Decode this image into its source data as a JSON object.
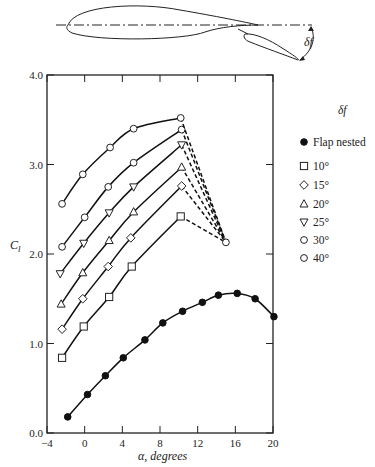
{
  "figure": {
    "diagram": {
      "description": "Airfoil with slotted trailing-edge flap deflected by angle delta_f",
      "flap_angle_label": "δf"
    }
  },
  "chart_data": {
    "type": "line",
    "title": "",
    "xlabel": "α, degrees",
    "ylabel": "Cl",
    "xlim": [
      -4,
      20
    ],
    "ylim": [
      0.0,
      4.0
    ],
    "xticks": [
      -4,
      0,
      4,
      8,
      12,
      16,
      20
    ],
    "yticks": [
      0.0,
      1.0,
      2.0,
      3.0,
      4.0
    ],
    "ytick_labels": [
      "0.0",
      "1.0",
      "2.0",
      "3.0",
      "4.0"
    ],
    "grid": false,
    "legend_title": "δf",
    "legend_position": "right, outside plot",
    "series": [
      {
        "name": "Flap nested",
        "marker": "filled-circle",
        "x": [
          -1.8,
          0.3,
          2.2,
          4.1,
          6.4,
          8.3,
          10.4,
          12.5,
          14.2,
          16.2,
          18.1,
          20.1
        ],
        "y": [
          0.18,
          0.43,
          0.64,
          0.84,
          1.04,
          1.23,
          1.36,
          1.46,
          1.54,
          1.56,
          1.5,
          1.3
        ]
      },
      {
        "name": "10°",
        "marker": "square",
        "x": [
          -2.4,
          -0.1,
          2.6,
          5.0,
          10.2
        ],
        "y": [
          0.84,
          1.19,
          1.52,
          1.86,
          2.42
        ]
      },
      {
        "name": "15°",
        "marker": "diamond",
        "x": [
          -2.4,
          -0.2,
          2.5,
          4.9,
          10.3
        ],
        "y": [
          1.16,
          1.5,
          1.86,
          2.18,
          2.76
        ]
      },
      {
        "name": "20°",
        "marker": "triangle-up",
        "x": [
          -2.5,
          -0.2,
          2.6,
          5.2,
          10.3
        ],
        "y": [
          1.44,
          1.79,
          2.15,
          2.47,
          2.97
        ]
      },
      {
        "name": "25°",
        "marker": "triangle-down",
        "x": [
          -2.6,
          -0.1,
          2.6,
          5.2,
          10.3
        ],
        "y": [
          1.78,
          2.12,
          2.46,
          2.75,
          3.22
        ]
      },
      {
        "name": "30°",
        "marker": "circle",
        "x": [
          -2.4,
          0.0,
          2.5,
          5.2,
          10.3
        ],
        "y": [
          2.08,
          2.41,
          2.75,
          3.02,
          3.39
        ]
      },
      {
        "name": "40°",
        "marker": "circle",
        "x": [
          -2.4,
          -0.2,
          2.7,
          5.2,
          10.2
        ],
        "y": [
          2.56,
          2.89,
          3.19,
          3.4,
          3.52
        ]
      }
    ],
    "annotations": [
      {
        "type": "post-stall dashed lines",
        "from": "each flapped curve endpoint (~10°)",
        "to": {
          "x": 15.0,
          "y": 2.13
        },
        "marker": "circle"
      }
    ]
  },
  "legend": {
    "title": "δf",
    "items": [
      {
        "label": "Flap nested",
        "symbol": "●"
      },
      {
        "label": "10°",
        "symbol": "□"
      },
      {
        "label": "15°",
        "symbol": "◇"
      },
      {
        "label": "20°",
        "symbol": "△"
      },
      {
        "label": "25°",
        "symbol": "▽"
      },
      {
        "label": "30°",
        "symbol": "○"
      },
      {
        "label": "40°",
        "symbol": "○"
      }
    ]
  }
}
